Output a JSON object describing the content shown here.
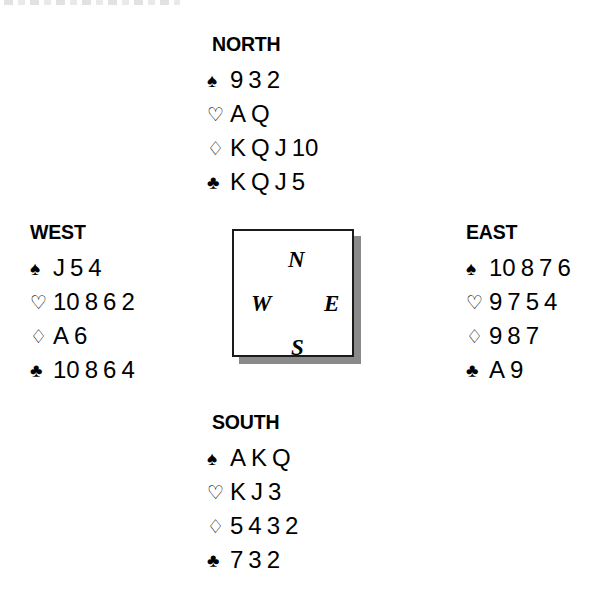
{
  "diagram": {
    "type": "bridge-deal",
    "suit_symbols": {
      "spade": "♠",
      "heart": "♡",
      "diamond": "♢",
      "club": "♣"
    },
    "suit_fill": {
      "spade": "solid",
      "heart": "outline",
      "diamond": "outline",
      "club": "solid"
    },
    "colors": {
      "ink": "#000000",
      "background": "#ffffff",
      "shadow": "#8a8a8a",
      "box_border": "#1a1a1a"
    }
  },
  "compass": {
    "north": "N",
    "west": "W",
    "east": "E",
    "south": "S"
  },
  "hands": {
    "north": {
      "label": "NORTH",
      "spades": [
        "9",
        "3",
        "2"
      ],
      "hearts": [
        "A",
        "Q"
      ],
      "diamonds": [
        "K",
        "Q",
        "J",
        "10"
      ],
      "clubs": [
        "K",
        "Q",
        "J",
        "5"
      ]
    },
    "west": {
      "label": "WEST",
      "spades": [
        "J",
        "5",
        "4"
      ],
      "hearts": [
        "10",
        "8",
        "6",
        "2"
      ],
      "diamonds": [
        "A",
        "6"
      ],
      "clubs": [
        "10",
        "8",
        "6",
        "4"
      ]
    },
    "east": {
      "label": "EAST",
      "spades": [
        "10",
        "8",
        "7",
        "6"
      ],
      "hearts": [
        "9",
        "7",
        "5",
        "4"
      ],
      "diamonds": [
        "9",
        "8",
        "7"
      ],
      "clubs": [
        "A",
        "9"
      ]
    },
    "south": {
      "label": "SOUTH",
      "spades": [
        "A",
        "K",
        "Q"
      ],
      "hearts": [
        "K",
        "J",
        "3"
      ],
      "diamonds": [
        "5",
        "4",
        "3",
        "2"
      ],
      "clubs": [
        "7",
        "3",
        "2"
      ]
    }
  }
}
